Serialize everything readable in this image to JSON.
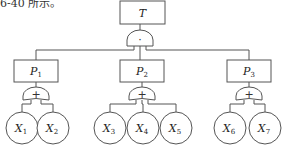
{
  "caption": "6-40 所示。",
  "top_event": {
    "label": "T",
    "gate": {
      "type": "AND",
      "symbol": "·"
    }
  },
  "intermediate_events": [
    {
      "id": "P1",
      "base": "P",
      "sub": "1",
      "gate": {
        "type": "OR",
        "symbol": "+"
      },
      "children": [
        {
          "base": "X",
          "sub": "1"
        },
        {
          "base": "X",
          "sub": "2"
        }
      ]
    },
    {
      "id": "P2",
      "base": "P",
      "sub": "2",
      "gate": {
        "type": "OR",
        "symbol": "+"
      },
      "children": [
        {
          "base": "X",
          "sub": "3"
        },
        {
          "base": "X",
          "sub": "4"
        },
        {
          "base": "X",
          "sub": "5"
        }
      ]
    },
    {
      "id": "P3",
      "base": "P",
      "sub": "3",
      "gate": {
        "type": "OR",
        "symbol": "+"
      },
      "children": [
        {
          "base": "X",
          "sub": "6"
        },
        {
          "base": "X",
          "sub": "7"
        }
      ]
    }
  ],
  "colors": {
    "stroke": "#555555",
    "text": "#222222",
    "background": "#ffffff"
  }
}
